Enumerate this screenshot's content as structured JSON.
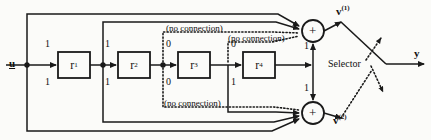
{
  "diagram": {
    "type": "signal-flow-block-diagram",
    "input": {
      "label": "u"
    },
    "output": {
      "label": "y"
    },
    "blocks": [
      {
        "id": "r1",
        "label": "r",
        "sub": "1",
        "x": 58,
        "y": 52,
        "w": 32,
        "h": 26
      },
      {
        "id": "r2",
        "label": "r",
        "sub": "2",
        "x": 118,
        "y": 52,
        "w": 32,
        "h": 26
      },
      {
        "id": "r3",
        "label": "r",
        "sub": "3",
        "x": 178,
        "y": 52,
        "w": 32,
        "h": 26
      },
      {
        "id": "r4",
        "label": "r",
        "sub": "4",
        "x": 243,
        "y": 52,
        "w": 32,
        "h": 26
      }
    ],
    "bit_labels": [
      {
        "value": "1",
        "x": 45,
        "y": 38,
        "for": "r1-top"
      },
      {
        "value": "1",
        "x": 45,
        "y": 76,
        "for": "r1-bottom"
      },
      {
        "value": "1",
        "x": 105,
        "y": 38,
        "for": "r2-top"
      },
      {
        "value": "1",
        "x": 105,
        "y": 76,
        "for": "r2-bottom"
      },
      {
        "value": "0",
        "x": 166,
        "y": 38,
        "for": "r3-top"
      },
      {
        "value": "0",
        "x": 166,
        "y": 76,
        "for": "r3-bottom"
      },
      {
        "value": "0",
        "x": 231,
        "y": 38,
        "for": "r4-top"
      },
      {
        "value": "1",
        "x": 231,
        "y": 76,
        "for": "r4-bottom"
      },
      {
        "value": "1",
        "x": 293,
        "y": 40,
        "for": "sum-top-feed"
      },
      {
        "value": "1",
        "x": 293,
        "y": 84,
        "for": "sum-bottom-feed"
      }
    ],
    "annotations": [
      {
        "text": "(no connection)",
        "x": 158,
        "y": 24
      },
      {
        "text": "(no connection)",
        "x": 223,
        "y": 34
      },
      {
        "text": "(no connection)",
        "x": 147,
        "y": 100
      }
    ],
    "sum_junctions": [
      {
        "id": "sum-top",
        "symbol": "+",
        "cx": 313,
        "cy": 31,
        "r": 11
      },
      {
        "id": "sum-bottom",
        "symbol": "+",
        "cx": 313,
        "cy": 113,
        "r": 11
      }
    ],
    "signals": [
      {
        "name": "v",
        "sup": "(1)",
        "x": 334,
        "y": 6
      },
      {
        "name": "v",
        "sup": "(2)",
        "x": 331,
        "y": 115
      }
    ],
    "selector": {
      "label": "Selector",
      "x": 351,
      "y": 64
    },
    "colors": {
      "line": "#1a1a1a",
      "dotted": "#1a1a1a",
      "text": "#111111",
      "background": "#fbfbf9"
    }
  }
}
